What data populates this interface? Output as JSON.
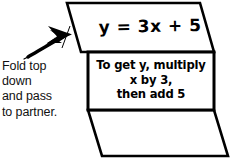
{
  "figure": {
    "paper": {
      "top_flap_name": "top-flap-panel",
      "middle_panel_name": "middle-rule-panel",
      "bottom_flap_name": "bottom-flap-panel",
      "stroke_color": "#000000",
      "fill_color": "#ffffff"
    },
    "equation": "y = 3x + 5",
    "rule": "To get y, multiply\nx by 3,\nthen add 5",
    "rule_lines": [
      "To get y, multiply",
      "x by 3,",
      "then add 5"
    ],
    "instruction": "Fold top\ndown\nand pass\nto partner.",
    "instruction_lines": [
      "Fold top",
      "down",
      "and pass",
      "to partner."
    ],
    "arrow": {
      "name": "fold-direction-arrow",
      "color": "#000000",
      "points_toward": "top flap left edge"
    }
  }
}
